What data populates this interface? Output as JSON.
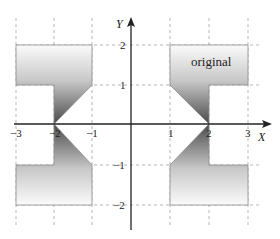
{
  "diagram": {
    "type": "coordinate-plane-reflection",
    "axes": {
      "x_label": "X",
      "y_label": "Y",
      "x_ticks": [
        "−3",
        "−2",
        "−1",
        "1",
        "2",
        "3"
      ],
      "y_ticks": [
        "2",
        "1",
        "−1",
        "−2"
      ]
    },
    "shape_label": "original",
    "shapes": [
      {
        "name": "original",
        "quadrant": "I",
        "vertices": [
          [
            1,
            2
          ],
          [
            3,
            2
          ],
          [
            3,
            1
          ],
          [
            2,
            1
          ],
          [
            2,
            0
          ],
          [
            1,
            1
          ]
        ]
      },
      {
        "name": "reflection-y-axis",
        "quadrant": "II",
        "vertices": [
          [
            -1,
            2
          ],
          [
            -3,
            2
          ],
          [
            -3,
            1
          ],
          [
            -2,
            1
          ],
          [
            -2,
            0
          ],
          [
            -1,
            1
          ]
        ]
      },
      {
        "name": "reflection-origin",
        "quadrant": "III",
        "vertices": [
          [
            -1,
            -2
          ],
          [
            -3,
            -2
          ],
          [
            -3,
            -1
          ],
          [
            -2,
            -1
          ],
          [
            -2,
            0
          ],
          [
            -1,
            -1
          ]
        ]
      },
      {
        "name": "reflection-x-axis",
        "quadrant": "IV",
        "vertices": [
          [
            1,
            -2
          ],
          [
            3,
            -2
          ],
          [
            3,
            -1
          ],
          [
            2,
            -1
          ],
          [
            2,
            0
          ],
          [
            1,
            -1
          ]
        ]
      }
    ],
    "colors": {
      "fill_dark": "#555555",
      "fill_light": "#f4f4f4",
      "grid": "#b0b0b0",
      "axis": "#222222"
    }
  }
}
